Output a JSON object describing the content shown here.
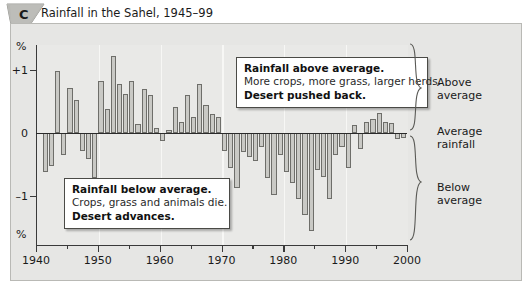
{
  "header": {
    "badge_letter": "C",
    "badge_icon": "pennant-badge",
    "title": "Rainfall in the Sahel, 1945–99"
  },
  "axes": {
    "y_unit_top": "%",
    "y_unit_bottom": "%",
    "y_ticks": [
      "+1",
      "0",
      "–1"
    ],
    "x_ticks": [
      "1940",
      "1950",
      "1960",
      "1970",
      "1980",
      "1990",
      "2000"
    ]
  },
  "callouts": {
    "above": {
      "line1": "Rainfall above average.",
      "line2": "More crops, more grass, larger herds.",
      "line3": "Desert pushed back."
    },
    "below": {
      "line1": "Rainfall below average.",
      "line2": "Crops, grass and animals die.",
      "line3": "Desert advances."
    }
  },
  "side_labels": {
    "above": "Above\naverage",
    "above_l1": "Above",
    "above_l2": "average",
    "average_l1": "Average",
    "average_l2": "rainfall",
    "below_l1": "Below",
    "below_l2": "average"
  },
  "colors": {
    "bar_fill": "#c9c9c5",
    "bar_stroke": "#6e6e6a",
    "plot_bg": "#e9e9e7",
    "frame_bg": "#e6e6e4",
    "axis": "#2a2a2a",
    "gridline": "#f7f7f5"
  },
  "chart_data": {
    "type": "bar",
    "title": "Rainfall in the Sahel, 1945–99",
    "xlabel": "",
    "ylabel": "%",
    "ylim": [
      -1.75,
      1.45
    ],
    "xlim": [
      1940,
      2000
    ],
    "grid": "vertical-decade",
    "legend": "none",
    "zero_reference": "Average rainfall",
    "annotations": [
      "Rainfall above average. More crops, more grass, larger herds. Desert pushed back.",
      "Rainfall below average. Crops, grass and animals die. Desert advances."
    ],
    "x": [
      1941,
      1942,
      1943,
      1944,
      1945,
      1946,
      1947,
      1948,
      1949,
      1950,
      1951,
      1952,
      1953,
      1954,
      1955,
      1956,
      1957,
      1958,
      1959,
      1960,
      1961,
      1962,
      1963,
      1964,
      1965,
      1966,
      1967,
      1968,
      1969,
      1970,
      1971,
      1972,
      1973,
      1974,
      1975,
      1976,
      1977,
      1978,
      1979,
      1980,
      1981,
      1982,
      1983,
      1984,
      1985,
      1986,
      1987,
      1988,
      1989,
      1990,
      1991,
      1992,
      1993,
      1994,
      1995,
      1996,
      1997,
      1998,
      1999
    ],
    "values": [
      -0.62,
      -0.52,
      0.98,
      -0.35,
      0.72,
      0.52,
      -0.28,
      -0.42,
      -0.72,
      0.82,
      0.38,
      1.22,
      0.78,
      0.62,
      0.82,
      0.15,
      0.7,
      0.6,
      0.08,
      -0.12,
      0.05,
      0.42,
      0.18,
      0.6,
      0.25,
      0.78,
      0.45,
      0.3,
      0.25,
      -0.28,
      -0.55,
      -0.88,
      -0.3,
      -0.38,
      -0.45,
      -0.22,
      -0.72,
      -0.98,
      -0.35,
      -0.62,
      -0.8,
      -1.05,
      -1.3,
      -1.55,
      -0.58,
      -0.7,
      -1.05,
      -0.35,
      -0.22,
      -0.55,
      0.12,
      -0.25,
      0.18,
      0.22,
      0.32,
      0.18,
      0.16,
      -0.1,
      -0.08
    ]
  }
}
